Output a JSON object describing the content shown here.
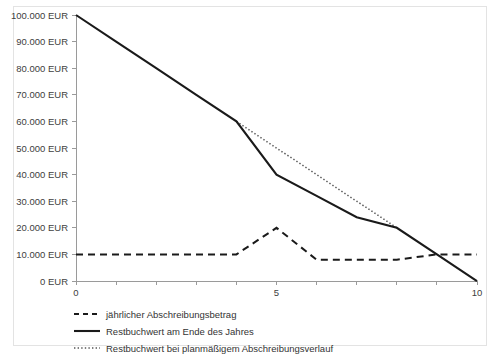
{
  "chart_data": {
    "type": "line",
    "title": "",
    "xlabel": "",
    "ylabel": "",
    "xlim": [
      0,
      10
    ],
    "ylim": [
      0,
      100000
    ],
    "grid": false,
    "legend_position": "bottom-left",
    "x_ticks": [
      0,
      1,
      2,
      3,
      4,
      5,
      6,
      7,
      8,
      9,
      10
    ],
    "x_tick_labels": [
      "0",
      "",
      "",
      "",
      "",
      "5",
      "",
      "",
      "",
      "",
      "10"
    ],
    "y_ticks": [
      0,
      10000,
      20000,
      30000,
      40000,
      50000,
      60000,
      70000,
      80000,
      90000,
      100000
    ],
    "y_tick_labels": [
      "0 EUR",
      "10.000 EUR",
      "20.000 EUR",
      "30.000 EUR",
      "40.000 EUR",
      "50.000 EUR",
      "60.000 EUR",
      "70.000 EUR",
      "80.000 EUR",
      "90.000 EUR",
      "100.000 EUR"
    ],
    "x": [
      0,
      1,
      2,
      3,
      4,
      5,
      6,
      7,
      8,
      9,
      10
    ],
    "series": [
      {
        "name": "jährlicher Abschreibungsbetrag",
        "style": "dashed",
        "color": "#1a1a1a",
        "x": [
          0,
          1,
          2,
          3,
          4,
          5,
          6,
          7,
          8,
          9,
          10
        ],
        "values": [
          10000,
          10000,
          10000,
          10000,
          10000,
          20000,
          8000,
          8000,
          8000,
          10000,
          10000
        ]
      },
      {
        "name": "Restbuchwert am Ende des Jahres",
        "style": "solid",
        "color": "#1a1a1a",
        "x": [
          0,
          1,
          2,
          3,
          4,
          5,
          6,
          7,
          8,
          9,
          10
        ],
        "values": [
          100000,
          90000,
          80000,
          70000,
          60000,
          40000,
          32000,
          24000,
          20000,
          10000,
          0
        ]
      },
      {
        "name": "Restbuchwert bei planmäßigem Abschreibungsverlauf",
        "style": "dotted",
        "color": "#555555",
        "x": [
          4,
          5,
          6,
          7,
          8
        ],
        "values": [
          60000,
          50000,
          40000,
          30000,
          20000
        ]
      }
    ]
  },
  "legend": {
    "items": [
      {
        "label": "jährlicher Abschreibungsbetrag",
        "style": "dashed"
      },
      {
        "label": "Restbuchwert am Ende des Jahres",
        "style": "solid"
      },
      {
        "label": "Restbuchwert bei planmäßigem Abschreibungsverlauf",
        "style": "dotted"
      }
    ]
  }
}
